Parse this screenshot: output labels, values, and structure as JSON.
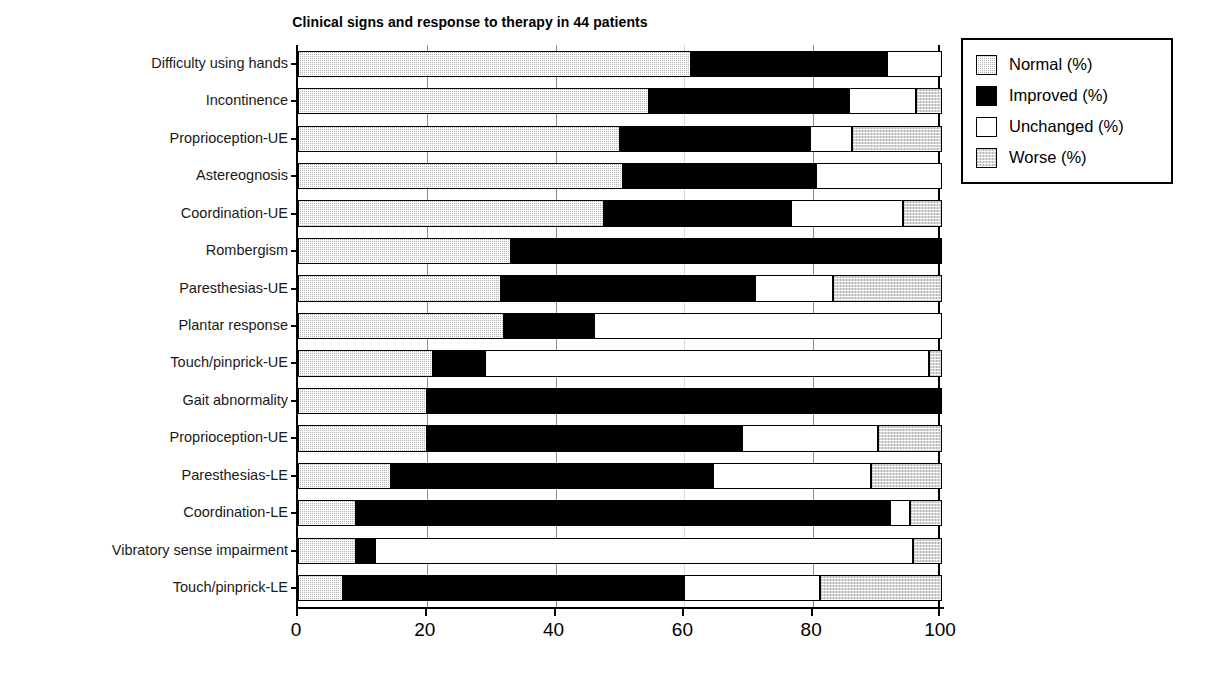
{
  "chart_data": {
    "type": "bar",
    "orientation": "horizontal",
    "stacked": true,
    "title": "Clinical signs and response to therapy in 44 patients",
    "xlabel": "",
    "ylabel": "",
    "xlim": [
      0,
      100
    ],
    "xticks": [
      0,
      20,
      40,
      60,
      80,
      100
    ],
    "xtick_labels": [
      "0",
      "20",
      "40",
      "60",
      "80",
      "100"
    ],
    "grid": true,
    "legend_position": "upper right",
    "legend": [
      "Normal (%)",
      "Improved (%)",
      "Unchanged (%)",
      "Worse (%)"
    ],
    "categories": [
      "Difficulty using hands",
      "Incontinence",
      "Proprioception-UE",
      "Astereognosis",
      "Coordination-UE",
      "Rombergism",
      "Paresthesias-UE",
      "Plantar response",
      "Touch/pinprick-UE",
      "Gait abnormality",
      "Proprioception-UE",
      "Paresthesias-LE",
      "Coordination-LE",
      "Vibratory sense impairment",
      "Touch/pinprick-LE"
    ],
    "series": [
      {
        "name": "Normal (%)",
        "values": [
          61,
          54.5,
          50,
          50.5,
          47.5,
          33,
          31.5,
          32,
          21,
          20,
          20,
          14.5,
          9,
          9,
          7
        ]
      },
      {
        "name": "Improved (%)",
        "values": [
          30.5,
          31,
          29.5,
          30,
          29,
          67,
          39.5,
          14,
          8,
          80,
          49,
          50,
          83,
          3,
          53
        ]
      },
      {
        "name": "Unchanged (%)",
        "values": [
          8.5,
          10.5,
          6.5,
          19.5,
          17.5,
          0,
          12,
          54,
          69,
          0,
          21,
          24.5,
          3,
          83.5,
          21
        ]
      },
      {
        "name": "Worse (%)",
        "values": [
          0,
          4,
          14,
          0,
          6,
          0,
          17,
          0,
          2,
          0,
          10,
          11,
          5,
          4.5,
          19
        ]
      }
    ]
  }
}
